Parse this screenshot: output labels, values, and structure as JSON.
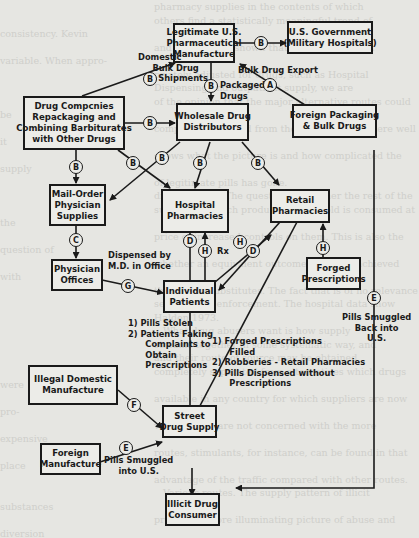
{
  "diagram": {
    "nodes": {
      "manufacturer": "Legitimate U.S.\nPharmaceutical\nManufacture",
      "government": "U.S. Government\n(Military Hospitals)",
      "drug_companies": "Drug Compcnies\nRepackaging and\nCombining Barbiturates\nwith Other Drugs",
      "wholesale": "Wholesale Drug\nDistributors",
      "foreign_packaging": "Foreign Packaging\n& Bulk Drugs",
      "mail_order": "Mail-Order\nPhysician\nSupplies",
      "hospital": "Hospital\nPharmacies",
      "retail": "Retail\nPharmacies",
      "physician_offices": "Physician\nOffices",
      "individual": "Individual\nPatients",
      "forged": "Forged\nPrescriptions",
      "illegal_domestic": "Illegal Domestic\nManufacture",
      "street": "Street\nDrug Supply",
      "foreign_manufacture": "Foreign\nManufacture",
      "consumer": "Illicit Drug\nConsumer"
    },
    "edge_labels": {
      "domestic_bulk": "Domestic\n     Bulk Drug\n       Shipments",
      "packaged": "Packaged\nDrugs",
      "bulk_export": "Bulk Drug Export",
      "dispensed": "Dispensed by\nM.D. in Office",
      "rx": "Rx",
      "patients_list": "1) Pills Stolen\n2) Patients Faking\n      Complaints to\n      Obtain\n      Prescriptions",
      "retail_list": "1) Forged Prescriptions\n      Filled\n2) Robberies - Retail Pharmacies\n3) Pills Dispensed without\n      Prescriptions",
      "smuggled_back": "Pills Smuggled\nBack into\nU.S.",
      "smuggled_into": "Pills Smuggled\ninto U.S."
    },
    "markers": {
      "mfr_gov": "B",
      "domestic_bulk": "B",
      "packaged": "B",
      "export": "A",
      "companies_wholesale": "B",
      "companies_mail": "B",
      "companies_hospital": "B",
      "wholesale_mail": "B",
      "wholesale_hospital": "B",
      "wholesale_retail": "B",
      "mail_physician": "C",
      "hospital_patients": "D",
      "patients_hospital": "H",
      "patients_retail": "H",
      "retail_patients": "D",
      "forged_retail": "H",
      "physician_patients": "G",
      "smuggled_back": "E",
      "illegal_street": "F",
      "foreign_street": "E"
    }
  }
}
